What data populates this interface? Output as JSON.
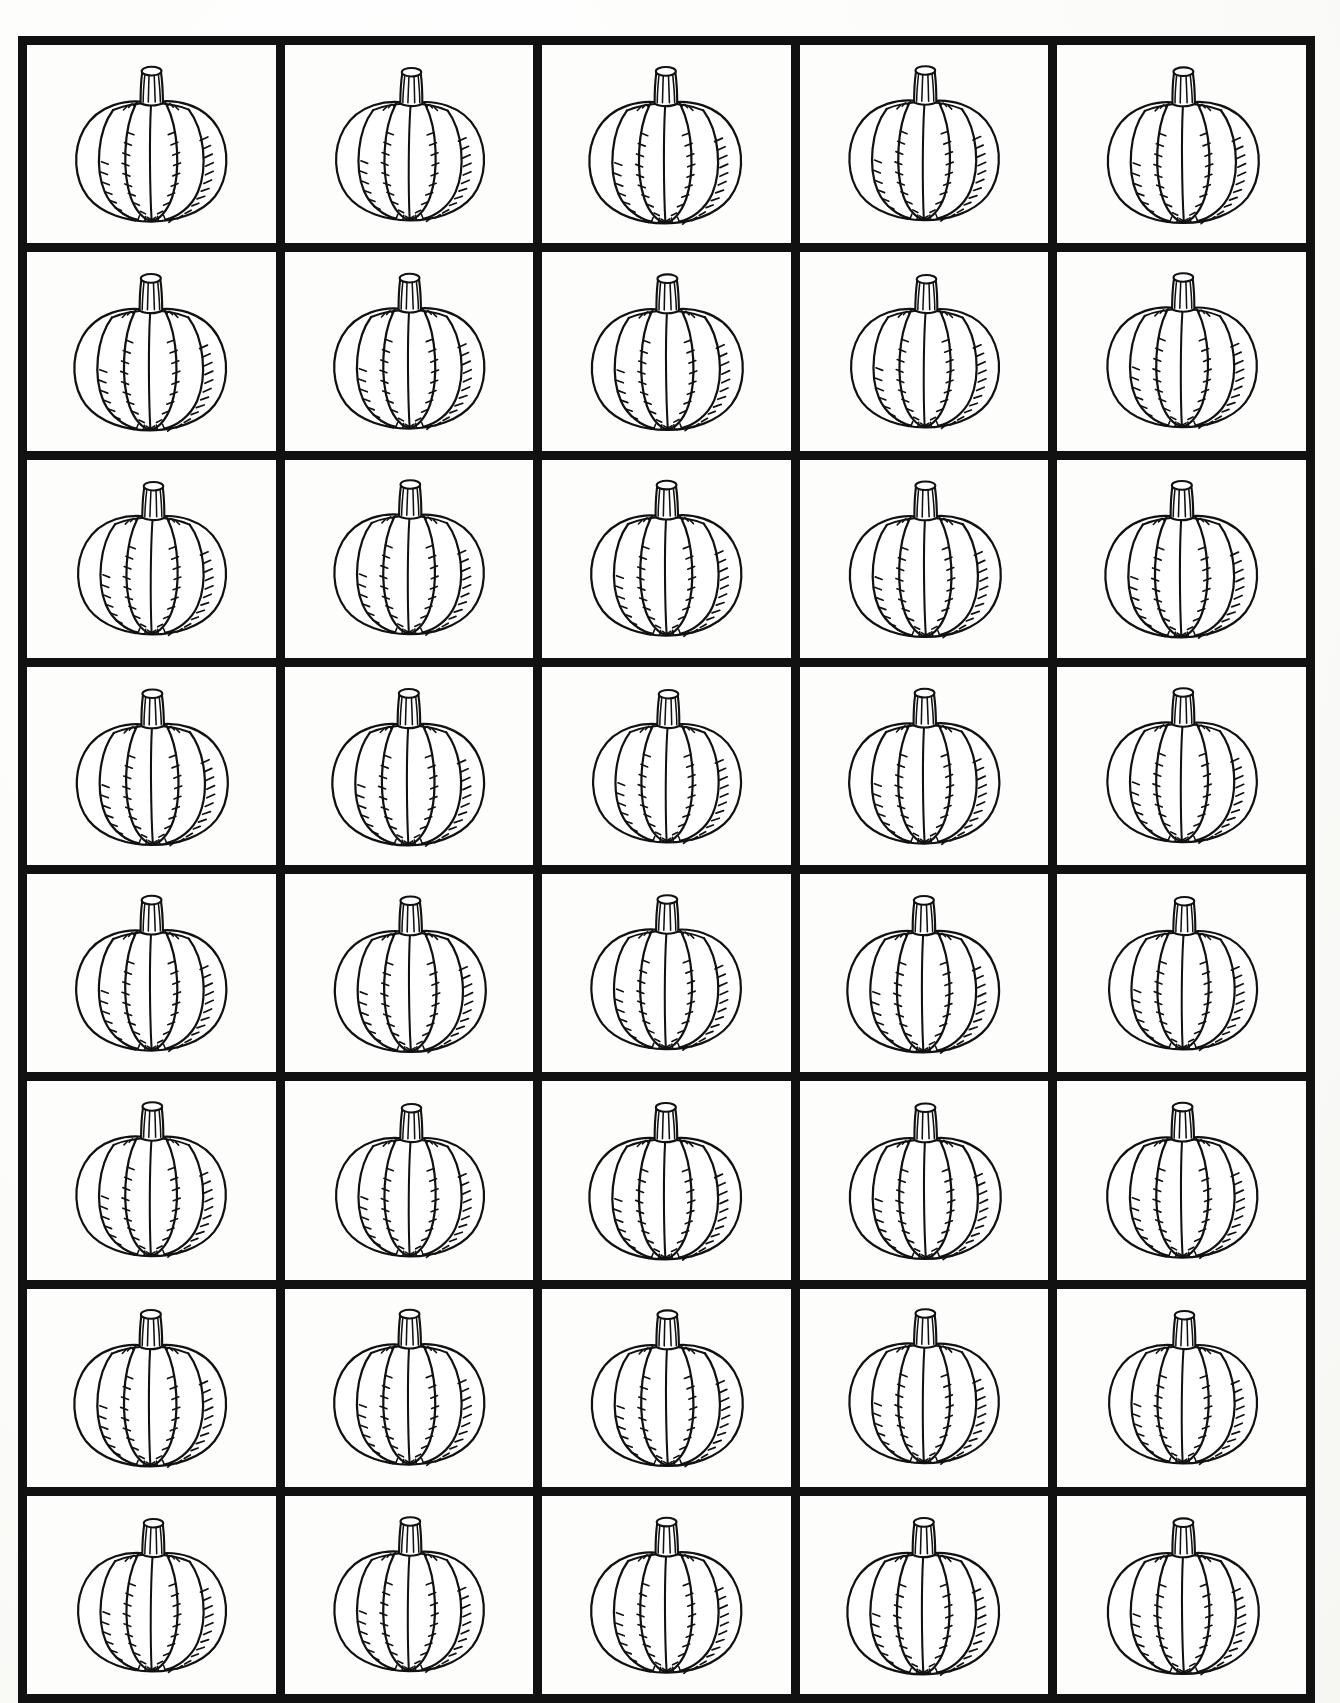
{
  "page": {
    "background_color": "#fdfdfb",
    "ink_color": "#111111",
    "width": 1340,
    "height": 1703
  },
  "grid": {
    "columns": 5,
    "rows": 8,
    "total_cells": 40,
    "border_color": "#111111",
    "border_width_px": 9,
    "cell_label": "pumpkin-outline-cell"
  },
  "artwork": {
    "name": "pumpkin-outline",
    "description": "Black and white line-art pumpkin outline for coloring",
    "features": [
      "ribbed-body",
      "five-lobes",
      "vertical-stem",
      "hatched-shading-ticks",
      "elliptical-stem-top"
    ],
    "stroke_color": "#111111",
    "fill_color": "#ffffff"
  },
  "cells": [
    {
      "row": 1,
      "col": 1,
      "index": 1,
      "jitter": "j1"
    },
    {
      "row": 1,
      "col": 2,
      "index": 2,
      "jitter": "j2"
    },
    {
      "row": 1,
      "col": 3,
      "index": 3,
      "jitter": "j3"
    },
    {
      "row": 1,
      "col": 4,
      "index": 4,
      "jitter": "j4"
    },
    {
      "row": 1,
      "col": 5,
      "index": 5,
      "jitter": "j5"
    },
    {
      "row": 2,
      "col": 1,
      "index": 6,
      "jitter": "j3"
    },
    {
      "row": 2,
      "col": 2,
      "index": 7,
      "jitter": "j1"
    },
    {
      "row": 2,
      "col": 3,
      "index": 8,
      "jitter": "j5"
    },
    {
      "row": 2,
      "col": 4,
      "index": 9,
      "jitter": "j2"
    },
    {
      "row": 2,
      "col": 5,
      "index": 10,
      "jitter": "j4"
    },
    {
      "row": 3,
      "col": 1,
      "index": 11,
      "jitter": "j2"
    },
    {
      "row": 3,
      "col": 2,
      "index": 12,
      "jitter": "j4"
    },
    {
      "row": 3,
      "col": 3,
      "index": 13,
      "jitter": "j1"
    },
    {
      "row": 3,
      "col": 4,
      "index": 14,
      "jitter": "j5"
    },
    {
      "row": 3,
      "col": 5,
      "index": 15,
      "jitter": "j3"
    },
    {
      "row": 4,
      "col": 1,
      "index": 16,
      "jitter": "j5"
    },
    {
      "row": 4,
      "col": 2,
      "index": 17,
      "jitter": "j3"
    },
    {
      "row": 4,
      "col": 3,
      "index": 18,
      "jitter": "j2"
    },
    {
      "row": 4,
      "col": 4,
      "index": 19,
      "jitter": "j1"
    },
    {
      "row": 4,
      "col": 5,
      "index": 20,
      "jitter": "j4"
    },
    {
      "row": 5,
      "col": 1,
      "index": 21,
      "jitter": "j1"
    },
    {
      "row": 5,
      "col": 2,
      "index": 22,
      "jitter": "j5"
    },
    {
      "row": 5,
      "col": 3,
      "index": 23,
      "jitter": "j4"
    },
    {
      "row": 5,
      "col": 4,
      "index": 24,
      "jitter": "j3"
    },
    {
      "row": 5,
      "col": 5,
      "index": 25,
      "jitter": "j2"
    },
    {
      "row": 6,
      "col": 1,
      "index": 26,
      "jitter": "j4"
    },
    {
      "row": 6,
      "col": 2,
      "index": 27,
      "jitter": "j2"
    },
    {
      "row": 6,
      "col": 3,
      "index": 28,
      "jitter": "j3"
    },
    {
      "row": 6,
      "col": 4,
      "index": 29,
      "jitter": "j5"
    },
    {
      "row": 6,
      "col": 5,
      "index": 30,
      "jitter": "j1"
    },
    {
      "row": 7,
      "col": 1,
      "index": 31,
      "jitter": "j3"
    },
    {
      "row": 7,
      "col": 2,
      "index": 32,
      "jitter": "j1"
    },
    {
      "row": 7,
      "col": 3,
      "index": 33,
      "jitter": "j5"
    },
    {
      "row": 7,
      "col": 4,
      "index": 34,
      "jitter": "j4"
    },
    {
      "row": 7,
      "col": 5,
      "index": 35,
      "jitter": "j2"
    },
    {
      "row": 8,
      "col": 1,
      "index": 36,
      "jitter": "j2"
    },
    {
      "row": 8,
      "col": 2,
      "index": 37,
      "jitter": "j4"
    },
    {
      "row": 8,
      "col": 3,
      "index": 38,
      "jitter": "j1"
    },
    {
      "row": 8,
      "col": 4,
      "index": 39,
      "jitter": "j3"
    },
    {
      "row": 8,
      "col": 5,
      "index": 40,
      "jitter": "j5"
    }
  ]
}
